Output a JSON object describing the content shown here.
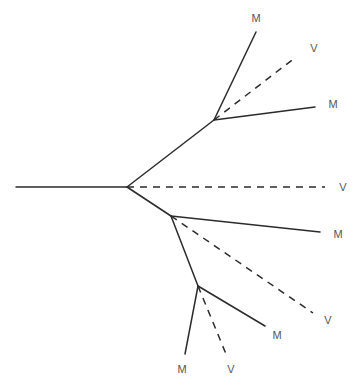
{
  "diagram": {
    "type": "phylogenetic-tree",
    "colors": {
      "edge": "#2b2b2b",
      "label": "#555555",
      "background": "#ffffff"
    },
    "nodes": {
      "start": [
        16,
        187
      ],
      "root": [
        127,
        187
      ],
      "upper": [
        214,
        120
      ],
      "lower": [
        171,
        216
      ],
      "bottom": [
        198,
        286
      ]
    },
    "edges": [
      {
        "id": "root-stem",
        "from": [
          16,
          187
        ],
        "to": [
          127,
          187
        ],
        "style": "solid"
      },
      {
        "id": "root-to-upper",
        "from": [
          127,
          187
        ],
        "to": [
          214,
          120
        ],
        "style": "solid"
      },
      {
        "id": "root-to-v",
        "from": [
          127,
          187
        ],
        "to": [
          325,
          187
        ],
        "style": "dashed"
      },
      {
        "id": "root-to-lower",
        "from": [
          127,
          187
        ],
        "to": [
          171,
          216
        ],
        "style": "solid"
      },
      {
        "id": "upper-to-m-top",
        "from": [
          214,
          120
        ],
        "to": [
          256,
          32
        ],
        "style": "solid"
      },
      {
        "id": "upper-to-v",
        "from": [
          214,
          120
        ],
        "to": [
          296,
          57
        ],
        "style": "dashed"
      },
      {
        "id": "upper-to-m-right",
        "from": [
          214,
          120
        ],
        "to": [
          315,
          107
        ],
        "style": "solid"
      },
      {
        "id": "lower-to-m",
        "from": [
          171,
          216
        ],
        "to": [
          320,
          232
        ],
        "style": "solid"
      },
      {
        "id": "lower-to-v",
        "from": [
          171,
          216
        ],
        "to": [
          313,
          313
        ],
        "style": "dashed"
      },
      {
        "id": "lower-to-bottom",
        "from": [
          171,
          216
        ],
        "to": [
          198,
          286
        ],
        "style": "solid"
      },
      {
        "id": "bottom-to-m-right",
        "from": [
          198,
          286
        ],
        "to": [
          265,
          326
        ],
        "style": "solid"
      },
      {
        "id": "bottom-to-v",
        "from": [
          198,
          286
        ],
        "to": [
          226,
          354
        ],
        "style": "dashed"
      },
      {
        "id": "bottom-to-m-left",
        "from": [
          198,
          286
        ],
        "to": [
          185,
          354
        ],
        "style": "solid"
      }
    ],
    "leaves": [
      {
        "id": "leaf-1",
        "text": "M",
        "x": 256,
        "y": 19
      },
      {
        "id": "leaf-2",
        "text": "V",
        "x": 314,
        "y": 49
      },
      {
        "id": "leaf-3",
        "text": "M",
        "x": 333,
        "y": 105
      },
      {
        "id": "leaf-4",
        "text": "V",
        "x": 343,
        "y": 188
      },
      {
        "id": "leaf-5",
        "text": "M",
        "x": 338,
        "y": 235
      },
      {
        "id": "leaf-6",
        "text": "V",
        "x": 328,
        "y": 321
      },
      {
        "id": "leaf-7",
        "text": "M",
        "x": 277,
        "y": 336
      },
      {
        "id": "leaf-8",
        "text": "M",
        "x": 182,
        "y": 370
      },
      {
        "id": "leaf-9",
        "text": "V",
        "x": 231,
        "y": 370
      }
    ]
  }
}
